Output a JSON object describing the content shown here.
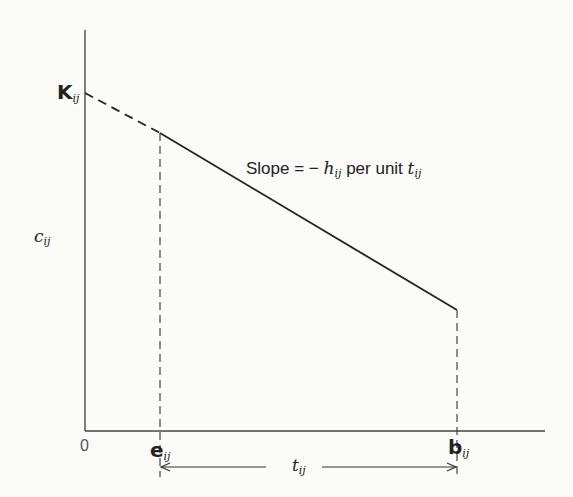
{
  "diagram": {
    "y_axis_label": {
      "main": "c",
      "sub": "ij"
    },
    "y_intercept_label": {
      "main": "K",
      "sub": "ij"
    },
    "origin_label": "0",
    "x_start_label": {
      "main": "e",
      "sub": "ij"
    },
    "x_end_label": {
      "main": "b",
      "sub": "ij"
    },
    "interval_label": {
      "main": "t",
      "sub": "ij"
    },
    "slope_annotation": {
      "prefix": "Slope = − ",
      "h": "h",
      "h_sub": "ij",
      "middle": " per unit ",
      "t": "t",
      "t_sub": "ij"
    }
  },
  "colors": {
    "line": "#222222",
    "background": "#fbfbf8"
  }
}
